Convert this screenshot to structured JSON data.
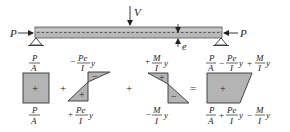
{
  "diagram": {
    "colors": {
      "beam_fill": "#b8b8b8",
      "beam_stroke": "#555555",
      "stress_fill": "#b4b4b4",
      "stroke": "#333333",
      "text": "#222222"
    },
    "beam": {
      "load_label": "V",
      "axial_left_label": "P",
      "axial_right_label": "P",
      "eccentricity_label": "e"
    },
    "blocks": [
      {
        "name": "axial",
        "top_label": {
          "num": "P",
          "den": "A",
          "prefix": "",
          "suffix": ""
        },
        "bottom_label": {
          "num": "P",
          "den": "A",
          "prefix": "",
          "suffix": ""
        },
        "sign": "+"
      },
      {
        "name": "eccentric-prestress",
        "top_label": {
          "num": "Pe",
          "den": "I",
          "prefix": "−",
          "suffix": "y"
        },
        "bottom_label": {
          "num": "Pe",
          "den": "I",
          "prefix": "+",
          "suffix": "y"
        },
        "top_sign": "−",
        "bottom_sign": "+"
      },
      {
        "name": "applied-moment",
        "top_label": {
          "num": "M",
          "den": "I",
          "prefix": "+",
          "suffix": "y"
        },
        "bottom_label": {
          "num": "M",
          "den": "I",
          "prefix": "−",
          "suffix": "y"
        },
        "top_sign": "+",
        "bottom_sign": "−"
      },
      {
        "name": "resultant",
        "top_terms": [
          {
            "num": "P",
            "den": "A",
            "prefix": "",
            "suffix": ""
          },
          {
            "num": "Pe",
            "den": "I",
            "prefix": "−",
            "suffix": "y"
          },
          {
            "num": "M",
            "den": "I",
            "prefix": "+",
            "suffix": "y"
          }
        ],
        "bottom_terms": [
          {
            "num": "P",
            "den": "A",
            "prefix": "",
            "suffix": ""
          },
          {
            "num": "Pe",
            "den": "I",
            "prefix": "+",
            "suffix": "y"
          },
          {
            "num": "M",
            "den": "I",
            "prefix": "−",
            "suffix": "y"
          }
        ],
        "sign": "+"
      }
    ],
    "operators": [
      "+",
      "+",
      "="
    ]
  }
}
